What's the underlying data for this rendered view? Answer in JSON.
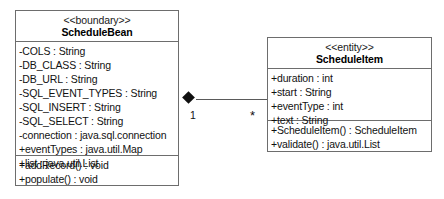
{
  "diagram": {
    "type": "uml-class-diagram",
    "classes": [
      {
        "id": "schedule-bean",
        "stereotype": "<<boundary>>",
        "name": "ScheduleBean",
        "attributes": [
          "-COLS : String",
          "-DB_CLASS : String",
          "-DB_URL : String",
          "-SQL_EVENT_TYPES : String",
          "-SQL_INSERT : String",
          "-SQL_SELECT : String",
          "-connection : java.sql.connection",
          "+eventTypes : java.util.Map",
          "+list : java.util.List"
        ],
        "operations": [
          "+addRecord() : void",
          "+populate() : void"
        ]
      },
      {
        "id": "schedule-item",
        "stereotype": "<<entity>>",
        "name": "ScheduleItem",
        "attributes": [
          "+duration : int",
          "+start : String",
          "+eventType : int",
          "+text : String"
        ],
        "operations": [
          "+ScheduleItem() : ScheduleItem",
          "+validate() : java.util.List"
        ]
      }
    ],
    "relationship": {
      "kind": "composition",
      "source_multiplicity": "1",
      "target_multiplicity": "*"
    },
    "colors": {
      "border": "#6d6d6d",
      "line": "#5a5a5a",
      "diamond": "#101010",
      "text": "#111111",
      "background": "#ffffff"
    }
  }
}
